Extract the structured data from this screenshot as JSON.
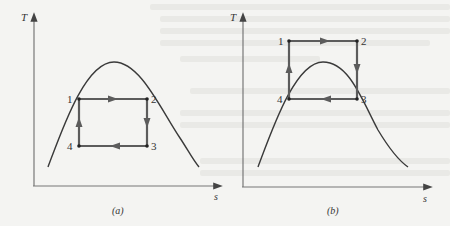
{
  "figures": [
    {
      "id": "a",
      "caption": "(a)",
      "y_axis_label": "T",
      "x_axis_label": "s",
      "points": [
        {
          "label": "1",
          "x": 79,
          "y": 99
        },
        {
          "label": "2",
          "x": 147,
          "y": 99
        },
        {
          "label": "3",
          "x": 147,
          "y": 146
        },
        {
          "label": "4",
          "x": 79,
          "y": 146
        }
      ],
      "description": "Rectangular cycle 1-2-3-4 inside the saturation dome"
    },
    {
      "id": "b",
      "caption": "(b)",
      "y_axis_label": "T",
      "x_axis_label": "s",
      "points": [
        {
          "label": "1",
          "x": 289,
          "y": 41
        },
        {
          "label": "2",
          "x": 357,
          "y": 41
        },
        {
          "label": "3",
          "x": 357,
          "y": 99
        },
        {
          "label": "4",
          "x": 289,
          "y": 99
        }
      ],
      "description": "Rectangular cycle 1-2-3-4 extending above the saturation dome"
    }
  ],
  "colors": {
    "axis": "#555555",
    "dome": "#3a3a3a",
    "cycle": "#5a5a5a",
    "background": "#f4f4f2"
  }
}
